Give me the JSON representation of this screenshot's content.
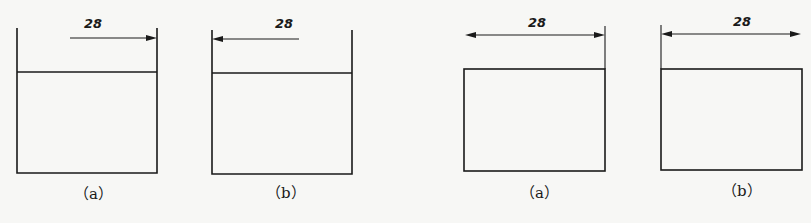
{
  "figures": [
    {
      "id": "fig1",
      "caption": "（a）",
      "dimension": "28",
      "arrow": "single-right"
    },
    {
      "id": "fig2",
      "caption": "（b）",
      "dimension": "28",
      "arrow": "single-left"
    },
    {
      "id": "fig3",
      "caption": "（a）",
      "dimension": "28",
      "arrow": "double"
    },
    {
      "id": "fig4",
      "caption": "（b）",
      "dimension": "28",
      "arrow": "double"
    }
  ],
  "colors": {
    "line": "#1a1a1a",
    "background": "#f7f7f5"
  }
}
